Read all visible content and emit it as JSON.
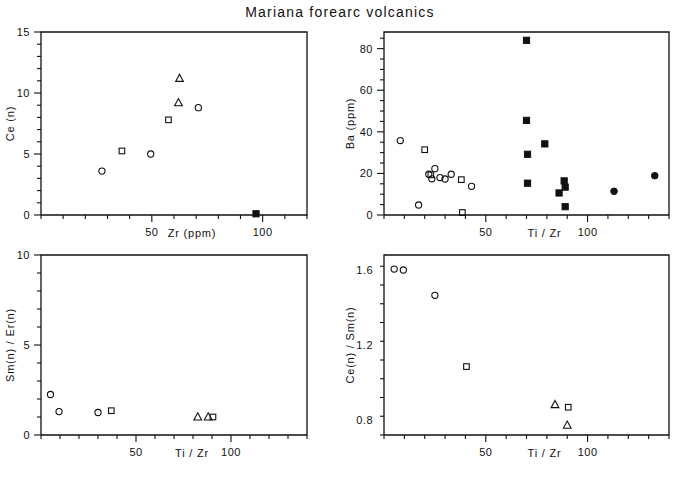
{
  "figure": {
    "title": "Mariana forearc volcanics",
    "marker_colors": {
      "open": "#111111",
      "filled": "#111111"
    },
    "background": "#ffffff"
  },
  "chart_data": [
    {
      "id": "panel-ce-zr",
      "type": "scatter",
      "title": "",
      "xlabel": "Zr (ppm)",
      "ylabel": "Ce (n)",
      "xlim": [
        0,
        120
      ],
      "ylim": [
        0,
        15
      ],
      "xticks": [
        50,
        100
      ],
      "xticklabels": [
        "50",
        "100"
      ],
      "yticks": [
        0,
        5,
        10,
        15
      ],
      "yticklabels": [
        "0",
        "5",
        "10",
        "15"
      ],
      "xminor_step": 10,
      "yminor_step": 1,
      "grid": false,
      "legend": "none",
      "series": [
        {
          "name": "open-circle",
          "marker": "circle-open",
          "points": [
            [
              27.5,
              3.6
            ],
            [
              49.5,
              5.0
            ],
            [
              71.0,
              8.8
            ]
          ]
        },
        {
          "name": "open-square",
          "marker": "square-open",
          "points": [
            [
              36.5,
              5.25
            ],
            [
              57.5,
              7.8
            ]
          ]
        },
        {
          "name": "open-triangle",
          "marker": "triangle-open",
          "points": [
            [
              62.5,
              11.2
            ],
            [
              62.0,
              9.2
            ]
          ]
        },
        {
          "name": "filled-square",
          "marker": "square-filled",
          "points": [
            [
              97.0,
              0.1
            ]
          ]
        }
      ]
    },
    {
      "id": "panel-ba-tizr",
      "type": "scatter",
      "title": "",
      "xlabel": "Ti / Zr",
      "ylabel": "Ba (ppm)",
      "xlim": [
        0,
        140
      ],
      "ylim": [
        0,
        88
      ],
      "xticks": [
        50,
        100
      ],
      "xticklabels": [
        "50",
        "100"
      ],
      "yticks": [
        0,
        20,
        40,
        60,
        80
      ],
      "yticklabels": [
        "0",
        "20",
        "40",
        "60",
        "80"
      ],
      "xminor_step": 10,
      "yminor_step": 5,
      "grid": false,
      "legend": "none",
      "series": [
        {
          "name": "open-circle",
          "marker": "circle-open",
          "points": [
            [
              8.0,
              35.8
            ],
            [
              17.0,
              4.8
            ],
            [
              22.0,
              19.6
            ],
            [
              23.5,
              17.4
            ],
            [
              25.0,
              22.3
            ],
            [
              27.5,
              18.0
            ],
            [
              30.0,
              17.3
            ],
            [
              33.0,
              19.6
            ],
            [
              43.0,
              13.8
            ]
          ]
        },
        {
          "name": "open-square",
          "marker": "square-open",
          "points": [
            [
              20.0,
              31.4
            ],
            [
              23.0,
              19.3
            ],
            [
              38.0,
              17.0
            ],
            [
              38.5,
              1.2
            ]
          ]
        },
        {
          "name": "filled-square",
          "marker": "square-filled",
          "points": [
            [
              70.0,
              84.0
            ],
            [
              70.0,
              45.5
            ],
            [
              70.5,
              29.2
            ],
            [
              70.5,
              15.3
            ],
            [
              79.0,
              34.2
            ],
            [
              86.0,
              10.6
            ],
            [
              88.5,
              16.4
            ],
            [
              89.0,
              13.4
            ],
            [
              89.0,
              4.0
            ]
          ]
        },
        {
          "name": "filled-circle",
          "marker": "circle-filled",
          "points": [
            [
              113.0,
              11.4
            ],
            [
              133.0,
              18.9
            ]
          ]
        }
      ]
    },
    {
      "id": "panel-smer-tizr",
      "type": "scatter",
      "title": "",
      "xlabel": "Ti / Zr",
      "ylabel": "Sm(n) / Er(n)",
      "xlim": [
        0,
        140
      ],
      "ylim": [
        0,
        10
      ],
      "xticks": [
        50,
        100
      ],
      "xticklabels": [
        "50",
        "100"
      ],
      "yticks": [
        0,
        5,
        10
      ],
      "yticklabels": [
        "0",
        "5",
        "10"
      ],
      "xminor_step": 10,
      "yminor_step": 1,
      "grid": false,
      "legend": "none",
      "series": [
        {
          "name": "open-circle",
          "marker": "circle-open",
          "points": [
            [
              5.0,
              2.25
            ],
            [
              9.5,
              1.3
            ],
            [
              30.0,
              1.25
            ]
          ]
        },
        {
          "name": "open-square",
          "marker": "square-open",
          "points": [
            [
              37.0,
              1.35
            ],
            [
              90.5,
              1.0
            ]
          ]
        },
        {
          "name": "open-triangle",
          "marker": "triangle-open",
          "points": [
            [
              82.5,
              1.0
            ],
            [
              88.0,
              1.0
            ]
          ]
        }
      ]
    },
    {
      "id": "panel-cesm-tizr",
      "type": "scatter",
      "title": "",
      "xlabel": "Ti / Zr",
      "ylabel": "Ce(n) / Sm(n)",
      "xlim": [
        0,
        140
      ],
      "ylim": [
        0.72,
        1.68
      ],
      "xticks": [
        50,
        100
      ],
      "xticklabels": [
        "50",
        "100"
      ],
      "yticks": [
        0.8,
        1.2,
        1.6
      ],
      "yticklabels": [
        "0.8",
        "1.2",
        "1.6"
      ],
      "xminor_step": 10,
      "yminor_step": 0.1,
      "grid": false,
      "legend": "none",
      "series": [
        {
          "name": "open-circle",
          "marker": "circle-open",
          "points": [
            [
              5.0,
              1.605
            ],
            [
              9.5,
              1.6
            ],
            [
              25.0,
              1.465
            ]
          ]
        },
        {
          "name": "open-square",
          "marker": "square-open",
          "points": [
            [
              40.5,
              1.085
            ],
            [
              90.5,
              0.868
            ]
          ]
        },
        {
          "name": "open-triangle",
          "marker": "triangle-open",
          "points": [
            [
              84.0,
              0.882
            ],
            [
              90.0,
              0.772
            ]
          ]
        }
      ]
    }
  ]
}
